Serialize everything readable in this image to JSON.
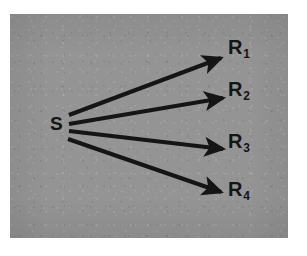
{
  "figure": {
    "panel": {
      "background_color": "#949494",
      "border_color": "#ffffff",
      "x": 10,
      "y": 14,
      "width": 278,
      "height": 224
    },
    "ink_color": "#151515"
  },
  "nodes": {
    "source": {
      "id": "S",
      "label": "S",
      "subscript": "",
      "x": 54,
      "y": 124,
      "role": "source"
    },
    "receivers": [
      {
        "id": "R1",
        "label": "R",
        "subscript": "1",
        "x": 232,
        "y": 46,
        "role": "receiver"
      },
      {
        "id": "R2",
        "label": "R",
        "subscript": "2",
        "x": 232,
        "y": 88,
        "role": "receiver"
      },
      {
        "id": "R3",
        "label": "R",
        "subscript": "3",
        "x": 232,
        "y": 140,
        "role": "receiver"
      },
      {
        "id": "R4",
        "label": "R",
        "subscript": "4",
        "x": 232,
        "y": 188,
        "role": "receiver"
      }
    ]
  },
  "arrows": [
    {
      "id": "arrow-s-r1",
      "from": "S",
      "to": "R1",
      "x1": 69,
      "y1": 115,
      "x2": 221,
      "y2": 58,
      "stroke_width": 4.2,
      "color": "#151515"
    },
    {
      "id": "arrow-s-r2",
      "from": "S",
      "to": "R2",
      "x1": 69,
      "y1": 124,
      "x2": 223,
      "y2": 98,
      "stroke_width": 4.2,
      "color": "#151515"
    },
    {
      "id": "arrow-s-r3",
      "from": "S",
      "to": "R3",
      "x1": 69,
      "y1": 131,
      "x2": 223,
      "y2": 149,
      "stroke_width": 4.2,
      "color": "#151515"
    },
    {
      "id": "arrow-s-r4",
      "from": "S",
      "to": "R4",
      "x1": 68,
      "y1": 139,
      "x2": 221,
      "y2": 192,
      "stroke_width": 4.2,
      "color": "#151515"
    }
  ],
  "chart_data": {
    "type": "diagram",
    "title": "",
    "nodes": [
      "S",
      "R1",
      "R2",
      "R3",
      "R4"
    ],
    "edges": [
      {
        "source": "S",
        "target": "R1",
        "directed": true
      },
      {
        "source": "S",
        "target": "R2",
        "directed": true
      },
      {
        "source": "S",
        "target": "R3",
        "directed": true
      },
      {
        "source": "S",
        "target": "R4",
        "directed": true
      }
    ],
    "legend": [],
    "annotations": []
  }
}
